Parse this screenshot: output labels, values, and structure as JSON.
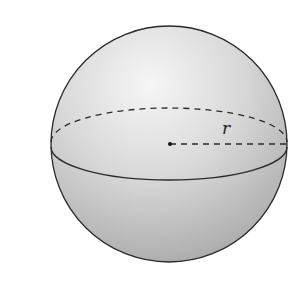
{
  "figure": {
    "type": "sphere",
    "radius_label": "r",
    "colors": {
      "outline": "#2a2a2a",
      "highlight": "#f4f4f4",
      "shade": "#a9a9a9",
      "background": "#ffffff"
    }
  }
}
